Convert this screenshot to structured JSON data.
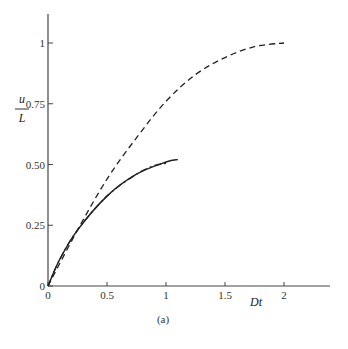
{
  "chart_data": {
    "type": "line",
    "title": "",
    "caption": "(a)",
    "xlabel": "Dt",
    "ylabel_numerator": "u",
    "ylabel_denominator": "L",
    "xlim": [
      0,
      2.4
    ],
    "ylim": [
      0,
      1.12
    ],
    "x_ticks": [
      0,
      0.5,
      1,
      1.5,
      2
    ],
    "x_tick_labels": [
      "0",
      "0.5",
      "1",
      "1.5",
      "2"
    ],
    "y_ticks": [
      0,
      0.25,
      0.5,
      0.75,
      1
    ],
    "y_tick_labels": [
      "0",
      "0.25",
      "0.50",
      "0.75",
      "1"
    ],
    "grid": false,
    "legend": "none",
    "series": [
      {
        "name": "dashed",
        "style": "dashed",
        "x": [
          0,
          0.25,
          0.5,
          0.75,
          1.0,
          1.25,
          1.5,
          1.75,
          2.0
        ],
        "y": [
          0,
          0.23,
          0.44,
          0.61,
          0.76,
          0.87,
          0.94,
          0.985,
          1.0
        ]
      },
      {
        "name": "solid",
        "style": "solid",
        "x": [
          0,
          0.1,
          0.25,
          0.5,
          0.75,
          1.0,
          1.1
        ],
        "y": [
          0,
          0.11,
          0.23,
          0.37,
          0.46,
          0.51,
          0.52
        ]
      },
      {
        "name": "dash-dot",
        "style": "dashdot",
        "x": [
          0,
          0.1,
          0.25,
          0.5,
          0.75,
          0.9,
          1.0
        ],
        "y": [
          0,
          0.11,
          0.23,
          0.37,
          0.46,
          0.495,
          0.505
        ]
      }
    ]
  }
}
